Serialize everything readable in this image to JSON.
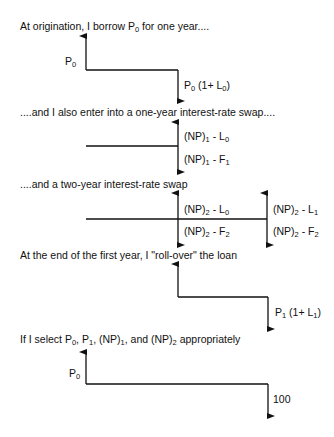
{
  "captions": {
    "c1": {
      "pre": "At origination, I borrow P",
      "sub": "0",
      "post": " for one year...."
    },
    "c2": "....and I also enter into a one-year interest-rate swap....",
    "c3": "....and a two-year interest-rate swap",
    "c4": "At the end of the first year, I \"roll-over\" the loan",
    "c5": {
      "a": "If I select P",
      "s1": "0",
      "b": ", P",
      "s2": "1",
      "c": ", (NP)",
      "s3": "1",
      "d": ", and (NP)",
      "s4": "2",
      "e": " appropriately"
    }
  },
  "diagram1": {
    "inflow": {
      "base": "P",
      "sub": "0"
    },
    "outflow": {
      "base": "P",
      "sub": "0",
      "mid": " (1+ L",
      "sub2": "0",
      "end": ")"
    }
  },
  "diagram2": {
    "up": {
      "base": "(NP)",
      "sub": "1",
      "mid": " - L",
      "sub2": "0"
    },
    "down": {
      "base": "(NP)",
      "sub": "1",
      "mid": " - F",
      "sub2": "1"
    }
  },
  "diagram3": {
    "up1": {
      "base": "(NP)",
      "sub": "2",
      "mid": " - L",
      "sub2": "0"
    },
    "down1": {
      "base": "(NP)",
      "sub": "2",
      "mid": " - F",
      "sub2": "2"
    },
    "up2": {
      "base": "(NP)",
      "sub": "2",
      "mid": " - L",
      "sub2": "1"
    },
    "down2": {
      "base": "(NP)",
      "sub": "2",
      "mid": " - F",
      "sub2": "2"
    }
  },
  "diagram4": {
    "outflow": {
      "base": "P",
      "sub": "1",
      "mid": " (1+ L",
      "sub2": "1",
      "end": ")"
    }
  },
  "diagram5": {
    "inflow": {
      "base": "P",
      "sub": "0"
    },
    "outflow": "100"
  },
  "colors": {
    "line": "#111111",
    "background": "#ffffff"
  }
}
